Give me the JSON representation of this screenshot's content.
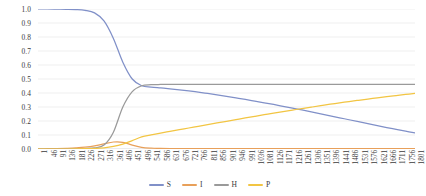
{
  "chart_data": {
    "type": "line",
    "title": "",
    "xlabel": "",
    "ylabel": "",
    "ylim": [
      0,
      1.0
    ],
    "grid": true,
    "legend_position": "bottom",
    "y_ticks": [
      "0.0",
      "0.1",
      "0.2",
      "0.3",
      "0.4",
      "0.5",
      "0.6",
      "0.7",
      "0.8",
      "0.9",
      "1.0"
    ],
    "categories": [
      1,
      46,
      91,
      136,
      181,
      226,
      271,
      316,
      361,
      406,
      451,
      496,
      541,
      586,
      631,
      676,
      721,
      766,
      811,
      856,
      901,
      946,
      991,
      1036,
      1081,
      1126,
      1171,
      1216,
      1261,
      1306,
      1351,
      1396,
      1441,
      1486,
      1531,
      1576,
      1621,
      1666,
      1711,
      1756,
      1801
    ],
    "series": [
      {
        "name": "S",
        "color": "#8090c8",
        "values": [
          1.0,
          1.0,
          0.999,
          0.998,
          0.996,
          0.99,
          0.972,
          0.915,
          0.79,
          0.62,
          0.5,
          0.452,
          0.442,
          0.436,
          0.43,
          0.423,
          0.415,
          0.406,
          0.397,
          0.387,
          0.376,
          0.365,
          0.354,
          0.342,
          0.33,
          0.318,
          0.305,
          0.292,
          0.279,
          0.265,
          0.251,
          0.237,
          0.223,
          0.209,
          0.195,
          0.181,
          0.167,
          0.153,
          0.14,
          0.127,
          0.115
        ]
      },
      {
        "name": "I",
        "color": "#e8a05a",
        "values": [
          0.001,
          0.002,
          0.003,
          0.005,
          0.008,
          0.013,
          0.022,
          0.036,
          0.05,
          0.048,
          0.028,
          0.012,
          0.006,
          0.004,
          0.003,
          0.003,
          0.003,
          0.003,
          0.003,
          0.003,
          0.003,
          0.003,
          0.003,
          0.003,
          0.003,
          0.003,
          0.003,
          0.003,
          0.003,
          0.003,
          0.003,
          0.003,
          0.003,
          0.003,
          0.003,
          0.003,
          0.003,
          0.003,
          0.003,
          0.003,
          0.003
        ]
      },
      {
        "name": "H",
        "color": "#9a9a9a",
        "values": [
          0.0,
          0.0,
          0.0,
          0.0,
          0.001,
          0.003,
          0.008,
          0.028,
          0.12,
          0.3,
          0.41,
          0.452,
          0.459,
          0.461,
          0.462,
          0.462,
          0.462,
          0.462,
          0.462,
          0.462,
          0.462,
          0.462,
          0.462,
          0.462,
          0.462,
          0.462,
          0.462,
          0.462,
          0.462,
          0.462,
          0.462,
          0.462,
          0.462,
          0.462,
          0.462,
          0.462,
          0.462,
          0.462,
          0.462,
          0.462,
          0.462
        ]
      },
      {
        "name": "P",
        "color": "#f2c543",
        "values": [
          0.0,
          0.0,
          0.0,
          0.0,
          0.001,
          0.002,
          0.004,
          0.008,
          0.018,
          0.035,
          0.06,
          0.086,
          0.101,
          0.114,
          0.126,
          0.138,
          0.15,
          0.162,
          0.174,
          0.186,
          0.198,
          0.21,
          0.222,
          0.233,
          0.245,
          0.256,
          0.267,
          0.278,
          0.289,
          0.299,
          0.31,
          0.32,
          0.329,
          0.339,
          0.348,
          0.357,
          0.365,
          0.374,
          0.382,
          0.39,
          0.397
        ]
      }
    ],
    "legend": [
      {
        "label": "S",
        "color": "#8090c8"
      },
      {
        "label": "I",
        "color": "#e8a05a"
      },
      {
        "label": "H",
        "color": "#9a9a9a"
      },
      {
        "label": "P",
        "color": "#f2c543"
      }
    ],
    "gridline_color": "#e8e8e8",
    "axis_color": "#d4d4d4"
  }
}
